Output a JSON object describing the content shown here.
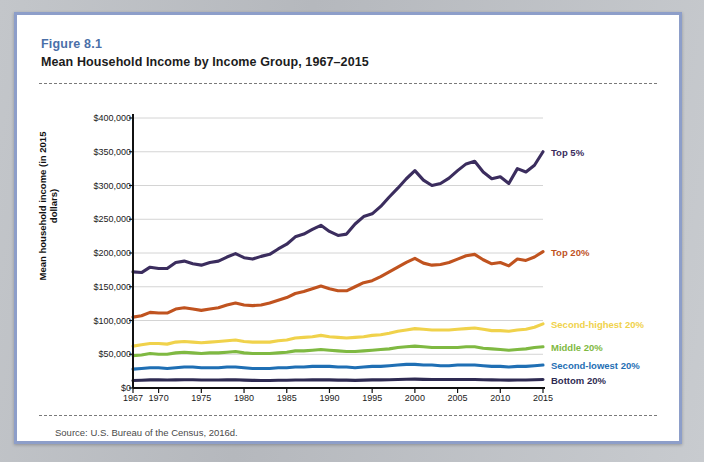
{
  "figure": {
    "number": "Figure 8.1",
    "title": "Mean Household Income by Income Group, 1967–2015",
    "source": "Source: U.S. Bureau of the Census, 2016d."
  },
  "colors": {
    "border": "#8d9ec9",
    "figure_number": "#4a6fa8",
    "top5": "#3b2d5e",
    "top20": "#c0531f",
    "second_highest": "#f0d24b",
    "middle": "#7fb942",
    "second_lowest": "#1f6fb4",
    "bottom": "#2e2a52",
    "gridline": "#d4d4d4",
    "axis": "#111111"
  },
  "chart_data": {
    "type": "line",
    "title": "Mean Household Income by Income Group, 1967–2015",
    "xlabel": "",
    "ylabel": "Mean household income (in 2015 dollars)",
    "ylim": [
      0,
      400000
    ],
    "ytick_labels": [
      "$400,000",
      "$350,000",
      "$300,000",
      "$250,000",
      "$200,000",
      "$150,000",
      "$100,000",
      "$50,000",
      "$0"
    ],
    "ytick_values": [
      400000,
      350000,
      300000,
      250000,
      200000,
      150000,
      100000,
      50000,
      0
    ],
    "xlim": [
      1967,
      2015
    ],
    "xtick_labels": [
      "1967",
      "1970",
      "1975",
      "1980",
      "1985",
      "1990",
      "1995",
      "2000",
      "2005",
      "2010",
      "2015"
    ],
    "xtick_values": [
      1967,
      1970,
      1975,
      1980,
      1985,
      1990,
      1995,
      2000,
      2005,
      2010,
      2015
    ],
    "grid": true,
    "legend_position": "right-inline",
    "x": [
      1967,
      1968,
      1969,
      1970,
      1971,
      1972,
      1973,
      1974,
      1975,
      1976,
      1977,
      1978,
      1979,
      1980,
      1981,
      1982,
      1983,
      1984,
      1985,
      1986,
      1987,
      1988,
      1989,
      1990,
      1991,
      1992,
      1993,
      1994,
      1995,
      1996,
      1997,
      1998,
      1999,
      2000,
      2001,
      2002,
      2003,
      2004,
      2005,
      2006,
      2007,
      2008,
      2009,
      2010,
      2011,
      2012,
      2013,
      2014,
      2015
    ],
    "series": [
      {
        "name": "Top 5%",
        "color": "#3b2d5e",
        "label": "Top 5%",
        "values": [
          172000,
          171000,
          179000,
          177000,
          177000,
          186000,
          188000,
          184000,
          182000,
          186000,
          188000,
          194000,
          199000,
          193000,
          191000,
          195000,
          198000,
          206000,
          213000,
          224000,
          228000,
          235000,
          241000,
          232000,
          226000,
          228000,
          243000,
          254000,
          258000,
          269000,
          283000,
          296000,
          310000,
          322000,
          308000,
          300000,
          303000,
          311000,
          322000,
          332000,
          336000,
          320000,
          310000,
          313000,
          303000,
          325000,
          320000,
          330000,
          350000
        ]
      },
      {
        "name": "Top 20%",
        "color": "#c0531f",
        "label": "Top 20%",
        "values": [
          105000,
          107000,
          112000,
          111000,
          111000,
          117000,
          119000,
          117000,
          115000,
          117000,
          119000,
          123000,
          126000,
          123000,
          122000,
          123000,
          126000,
          130000,
          134000,
          140000,
          143000,
          147000,
          151000,
          147000,
          144000,
          144000,
          150000,
          156000,
          159000,
          165000,
          172000,
          179000,
          186000,
          192000,
          185000,
          182000,
          183000,
          186000,
          191000,
          196000,
          198000,
          190000,
          184000,
          186000,
          181000,
          191000,
          189000,
          194000,
          202000
        ]
      },
      {
        "name": "Second-highest 20%",
        "color": "#f0d24b",
        "label": "Second-highest 20%",
        "values": [
          62000,
          64000,
          66000,
          66000,
          65000,
          68000,
          69000,
          68000,
          67000,
          68000,
          69000,
          70000,
          71000,
          69000,
          68000,
          68000,
          68000,
          70000,
          71000,
          74000,
          75000,
          76000,
          78000,
          76000,
          75000,
          74000,
          75000,
          76000,
          78000,
          79000,
          81000,
          84000,
          86000,
          88000,
          87000,
          86000,
          86000,
          86000,
          87000,
          88000,
          89000,
          87000,
          85000,
          85000,
          84000,
          86000,
          87000,
          90000,
          95000
        ]
      },
      {
        "name": "Middle 20%",
        "color": "#7fb942",
        "label": "Middle 20%",
        "values": [
          48000,
          49000,
          51000,
          50000,
          50000,
          52000,
          53000,
          52000,
          51000,
          52000,
          52000,
          53000,
          54000,
          52000,
          51000,
          51000,
          51000,
          52000,
          53000,
          55000,
          55000,
          56000,
          57000,
          56000,
          55000,
          54000,
          54000,
          55000,
          56000,
          57000,
          58000,
          60000,
          61000,
          62000,
          61000,
          60000,
          60000,
          60000,
          60000,
          61000,
          61000,
          59000,
          58000,
          57000,
          56000,
          57000,
          58000,
          60000,
          61000
        ]
      },
      {
        "name": "Second-lowest 20%",
        "color": "#1f6fb4",
        "label": "Second-lowest 20%",
        "values": [
          28000,
          29000,
          30000,
          30000,
          29000,
          30000,
          31000,
          31000,
          30000,
          30000,
          30000,
          31000,
          31000,
          30000,
          29000,
          29000,
          29000,
          30000,
          30000,
          31000,
          31000,
          32000,
          32000,
          32000,
          31000,
          31000,
          30000,
          31000,
          32000,
          32000,
          33000,
          34000,
          35000,
          35000,
          34000,
          34000,
          33000,
          33000,
          34000,
          34000,
          34000,
          33000,
          32000,
          32000,
          31000,
          32000,
          32000,
          33000,
          34000
        ]
      },
      {
        "name": "Bottom 20%",
        "color": "#2e2a52",
        "label": "Bottom 20%",
        "values": [
          11000,
          11500,
          12000,
          12000,
          11800,
          12000,
          12300,
          12200,
          11800,
          11900,
          11900,
          12100,
          12200,
          11700,
          11300,
          11200,
          11100,
          11400,
          11500,
          11800,
          11900,
          12100,
          12300,
          12100,
          11700,
          11600,
          11300,
          11600,
          12000,
          12100,
          12300,
          12700,
          13000,
          13100,
          12800,
          12600,
          12500,
          12500,
          12600,
          12700,
          12700,
          12300,
          12000,
          11900,
          11600,
          11800,
          11900,
          12200,
          12500
        ]
      }
    ]
  }
}
